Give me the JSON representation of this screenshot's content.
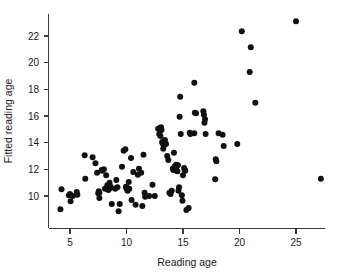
{
  "chart_data": {
    "type": "scatter",
    "title": "",
    "xlabel": "Reading age",
    "ylabel": "Fitted reading age",
    "xlim": [
      3.2,
      28.2
    ],
    "ylim": [
      8.3,
      23.8
    ],
    "xticks": [
      5,
      10,
      15,
      20,
      25
    ],
    "yticks": [
      10,
      12,
      14,
      16,
      18,
      20,
      22
    ],
    "xtick_labels": [
      "5",
      "10",
      "15",
      "20",
      "25"
    ],
    "ytick_labels": [
      "10",
      "12",
      "14",
      "16",
      "18",
      "20",
      "22"
    ],
    "grid": false,
    "legend": null,
    "marker": "filled-circle",
    "marker_color": "#111111",
    "marker_size": 3.0,
    "n_points": 118,
    "points": [
      [
        4.15,
        9.0
      ],
      [
        4.25,
        10.5
      ],
      [
        4.9,
        10.05
      ],
      [
        5.0,
        10.15
      ],
      [
        5.05,
        9.6
      ],
      [
        5.25,
        10.0
      ],
      [
        5.6,
        10.3
      ],
      [
        5.65,
        10.1
      ],
      [
        6.3,
        13.05
      ],
      [
        6.35,
        11.3
      ],
      [
        7.0,
        12.9
      ],
      [
        7.25,
        12.45
      ],
      [
        7.4,
        11.75
      ],
      [
        7.5,
        10.2
      ],
      [
        7.55,
        10.35
      ],
      [
        7.6,
        10.25
      ],
      [
        7.6,
        9.85
      ],
      [
        7.8,
        11.95
      ],
      [
        7.85,
        11.9
      ],
      [
        8.0,
        12.0
      ],
      [
        8.1,
        10.55
      ],
      [
        8.2,
        11.55
      ],
      [
        8.3,
        10.8
      ],
      [
        8.35,
        10.5
      ],
      [
        8.4,
        10.45
      ],
      [
        8.5,
        11.0
      ],
      [
        8.55,
        10.6
      ],
      [
        8.6,
        10.7
      ],
      [
        8.7,
        9.4
      ],
      [
        9.0,
        10.55
      ],
      [
        9.1,
        11.2
      ],
      [
        9.2,
        10.65
      ],
      [
        9.3,
        8.85
      ],
      [
        9.4,
        9.4
      ],
      [
        9.6,
        12.2
      ],
      [
        9.75,
        13.4
      ],
      [
        9.9,
        13.5
      ],
      [
        9.95,
        10.7
      ],
      [
        10.0,
        10.55
      ],
      [
        10.05,
        10.6
      ],
      [
        10.1,
        10.4
      ],
      [
        10.2,
        11.05
      ],
      [
        10.25,
        10.55
      ],
      [
        10.4,
        12.85
      ],
      [
        10.45,
        9.7
      ],
      [
        10.6,
        11.8
      ],
      [
        10.8,
        9.35
      ],
      [
        11.0,
        11.6
      ],
      [
        11.1,
        12.05
      ],
      [
        11.3,
        11.75
      ],
      [
        11.4,
        9.25
      ],
      [
        11.5,
        13.1
      ],
      [
        11.6,
        10.25
      ],
      [
        11.65,
        9.95
      ],
      [
        12.0,
        10.0
      ],
      [
        12.3,
        10.85
      ],
      [
        12.5,
        10.0
      ],
      [
        12.8,
        15.05
      ],
      [
        12.9,
        14.65
      ],
      [
        12.95,
        15.1
      ],
      [
        13.0,
        14.5
      ],
      [
        13.05,
        15.15
      ],
      [
        13.1,
        14.95
      ],
      [
        13.15,
        14.05
      ],
      [
        13.2,
        13.95
      ],
      [
        13.25,
        13.55
      ],
      [
        13.3,
        13.8
      ],
      [
        13.4,
        14.2
      ],
      [
        13.5,
        13.9
      ],
      [
        13.6,
        13.0
      ],
      [
        13.7,
        12.7
      ],
      [
        13.8,
        10.25
      ],
      [
        13.9,
        10.15
      ],
      [
        14.0,
        10.4
      ],
      [
        14.1,
        12.05
      ],
      [
        14.15,
        11.95
      ],
      [
        14.2,
        13.25
      ],
      [
        14.25,
        12.15
      ],
      [
        14.3,
        12.25
      ],
      [
        14.35,
        12.2
      ],
      [
        14.4,
        12.35
      ],
      [
        14.45,
        11.9
      ],
      [
        14.5,
        11.85
      ],
      [
        14.55,
        12.3
      ],
      [
        14.6,
        10.4
      ],
      [
        14.65,
        10.65
      ],
      [
        14.7,
        15.95
      ],
      [
        14.75,
        17.45
      ],
      [
        14.8,
        14.65
      ],
      [
        14.9,
        10.05
      ],
      [
        14.95,
        9.65
      ],
      [
        15.0,
        11.55
      ],
      [
        15.1,
        12.1
      ],
      [
        15.15,
        11.95
      ],
      [
        15.2,
        11.9
      ],
      [
        15.3,
        8.95
      ],
      [
        15.5,
        9.1
      ],
      [
        15.6,
        14.75
      ],
      [
        15.65,
        14.65
      ],
      [
        16.0,
        18.5
      ],
      [
        16.0,
        14.7
      ],
      [
        16.05,
        16.25
      ],
      [
        16.15,
        16.2
      ],
      [
        16.8,
        16.35
      ],
      [
        16.85,
        16.1
      ],
      [
        16.9,
        15.5
      ],
      [
        16.95,
        15.75
      ],
      [
        17.0,
        14.65
      ],
      [
        17.85,
        11.25
      ],
      [
        17.9,
        12.75
      ],
      [
        17.95,
        12.6
      ],
      [
        18.15,
        14.7
      ],
      [
        18.5,
        14.6
      ],
      [
        18.6,
        13.75
      ],
      [
        19.8,
        13.9
      ],
      [
        20.2,
        22.35
      ],
      [
        20.9,
        19.3
      ],
      [
        21.0,
        21.15
      ],
      [
        21.4,
        17.0
      ],
      [
        25.0,
        23.1
      ],
      [
        27.2,
        11.3
      ]
    ]
  }
}
